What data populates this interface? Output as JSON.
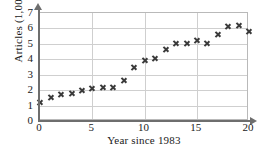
{
  "chart_data": {
    "type": "scatter",
    "title": "",
    "xlabel": "Year since 1983",
    "ylabel": "Articles (1,000)",
    "xlim": [
      0,
      20
    ],
    "ylim": [
      0,
      7
    ],
    "xticks": [
      "0",
      "5",
      "10",
      "15",
      "20"
    ],
    "xtick_values": [
      0,
      5,
      10,
      15,
      20
    ],
    "yticks": [
      "0",
      "1",
      "2",
      "3",
      "4",
      "5",
      "6",
      "7"
    ],
    "ytick_values": [
      0,
      1,
      2,
      3,
      4,
      5,
      6,
      7
    ],
    "grid": true,
    "legend": null,
    "marker": "x",
    "marker_color": "#3a3a3a",
    "x": [
      0,
      1,
      2,
      3,
      4,
      5,
      6,
      7,
      8,
      9,
      10,
      11,
      12,
      13,
      14,
      15,
      16,
      17,
      18,
      19,
      20
    ],
    "values": [
      1.2,
      1.5,
      1.75,
      1.8,
      2.0,
      2.1,
      2.2,
      2.2,
      2.6,
      3.5,
      3.9,
      4.05,
      4.65,
      5.0,
      5.05,
      5.2,
      5.05,
      5.6,
      6.1,
      6.2,
      5.8
    ]
  },
  "axis": {
    "y_title": "Articles (1,000)",
    "x_title": "Year since 1983"
  },
  "colors": {
    "marker": "#3a3a3a",
    "axis": "#6e6e6e",
    "grid": "#cfcfcf",
    "frame": "#b9b9b9"
  }
}
